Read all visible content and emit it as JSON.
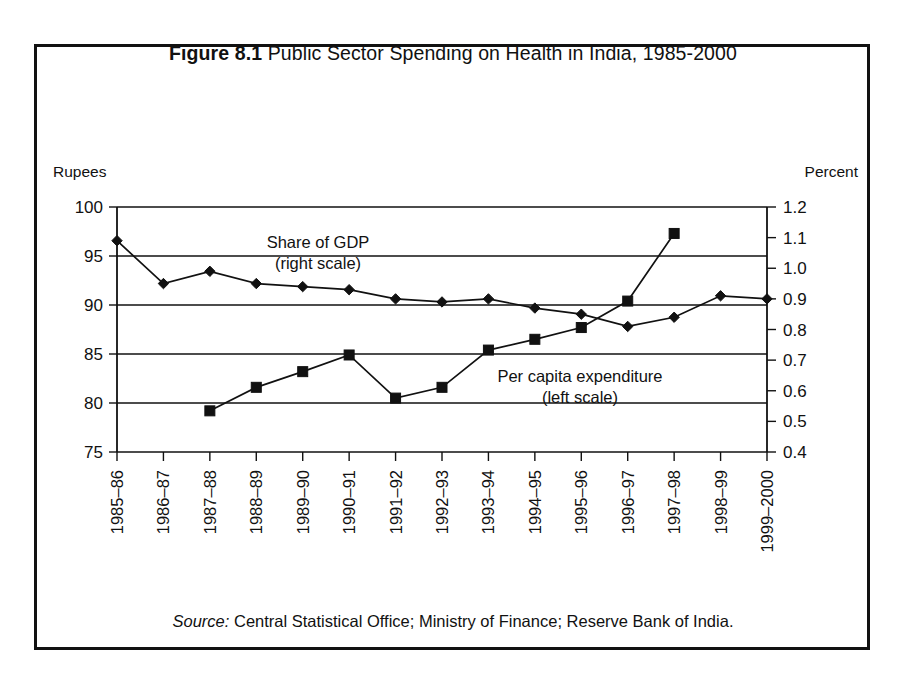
{
  "figure": {
    "number_label": "Figure 8.1",
    "title": "Public Sector Spending on Health in India, 1985-2000",
    "source_label": "Source:",
    "source_text": "Central Statistical Office; Ministry of Finance; Reserve Bank of India.",
    "border_color": "#111111"
  },
  "chart_data": {
    "type": "line",
    "title": "Public Sector Spending on Health in India, 1985-2000",
    "xlabel": "",
    "ylabel": "Rupees",
    "y2label": "Percent",
    "left_axis_title": "Rupees",
    "right_axis_title": "Percent",
    "grid": true,
    "legend_position": "inline-annotation",
    "categories": [
      "1985–86",
      "1986–87",
      "1987–88",
      "1988–89",
      "1989–90",
      "1990–91",
      "1991–92",
      "1992–93",
      "1993–94",
      "1994–95",
      "1995–96",
      "1996–97",
      "1997–98",
      "1998–99",
      "1999–2000"
    ],
    "ylim": [
      75,
      100
    ],
    "yticks": [
      75,
      80,
      85,
      90,
      95,
      100
    ],
    "ytick_labels": [
      "75",
      "80",
      "85",
      "90",
      "95",
      "100"
    ],
    "y2lim": [
      0.4,
      1.2
    ],
    "y2ticks": [
      0.4,
      0.5,
      0.6,
      0.7,
      0.8,
      0.9,
      1.0,
      1.1,
      1.2
    ],
    "y2tick_labels": [
      "0.4",
      "0.5",
      "0.6",
      "0.7",
      "0.8",
      "0.9",
      "1.0",
      "1.1",
      "1.2"
    ],
    "series": [
      {
        "name": "Share of GDP",
        "annotation_line1": "Share of GDP",
        "annotation_line2": "(right scale)",
        "axis": "right",
        "units": "percent of GDP",
        "marker": "diamond",
        "values": [
          1.09,
          0.95,
          0.99,
          0.95,
          0.94,
          0.93,
          0.9,
          0.89,
          0.9,
          0.87,
          0.85,
          0.81,
          0.84,
          0.91,
          0.9
        ]
      },
      {
        "name": "Per capita expenditure",
        "annotation_line1": "Per capita expenditure",
        "annotation_line2": "(left scale)",
        "axis": "left",
        "units": "Rupees",
        "marker": "square",
        "values": [
          null,
          null,
          79.2,
          81.6,
          83.2,
          84.9,
          80.5,
          81.6,
          85.4,
          86.5,
          87.7,
          90.4,
          97.3,
          null,
          null
        ]
      }
    ]
  }
}
